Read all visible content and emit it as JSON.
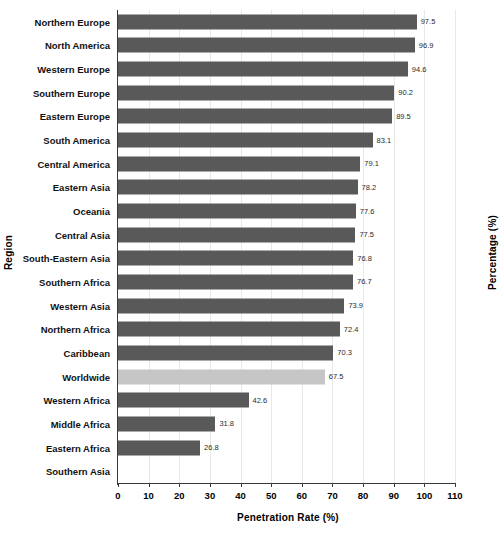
{
  "chart_data": {
    "type": "bar",
    "orientation": "horizontal",
    "title": "",
    "xlabel": "Penetration Rate (%)",
    "ylabel": "Region",
    "ylabel_right": "Percentage (%)",
    "xlim": [
      0,
      110
    ],
    "xticks": [
      0,
      10,
      20,
      30,
      40,
      50,
      60,
      70,
      80,
      90,
      100,
      110
    ],
    "grid": "vertical-only",
    "legend": "none",
    "bar_color": "#595959",
    "highlight_color": "#c6c6c6",
    "highlight_category": "Worldwide",
    "categories": [
      "Northern Europe",
      "North America",
      "Western Europe",
      "Southern Europe",
      "Eastern Europe",
      "South America",
      "Central America",
      "Eastern Asia",
      "Oceania",
      "Central Asia",
      "South-Eastern Asia",
      "Southern Africa",
      "Western Asia",
      "Northern Africa",
      "Caribbean",
      "Worldwide",
      "Western Africa",
      "Middle Africa",
      "Eastern Africa",
      "Southern Asia"
    ],
    "values": [
      97.5,
      96.9,
      94.6,
      90.2,
      89.5,
      83.1,
      79.1,
      78.2,
      77.6,
      77.5,
      76.8,
      76.7,
      73.9,
      72.4,
      70.3,
      67.5,
      42.6,
      31.8,
      26.8,
      null
    ],
    "value_labels": [
      "97.5",
      "96.9",
      "94.6",
      "90.2",
      "89.5",
      "83.1",
      "79.1",
      "78.2",
      "77.6",
      "77.5",
      "76.8",
      "76.7",
      "73.9",
      "72.4",
      "70.3",
      "67.5",
      "42.6",
      "31.8",
      "26.8",
      ""
    ]
  }
}
